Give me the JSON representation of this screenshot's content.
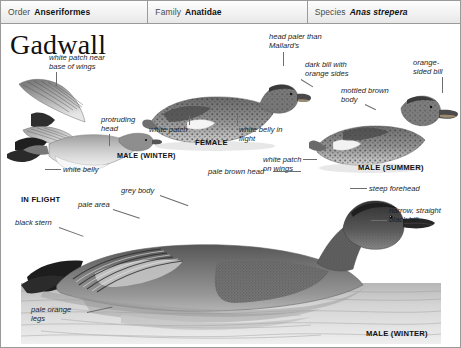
{
  "taxonomy": {
    "order": {
      "rank": "Order",
      "value": "Anseriformes"
    },
    "family": {
      "rank": "Family",
      "value": "Anatidae"
    },
    "species": {
      "rank": "Species",
      "value": "Anas strepera"
    }
  },
  "plate": {
    "title": "Gadwall",
    "annotations": {
      "white_patch_wings": "white patch near\nbase of wings",
      "protruding_head": "protruding\nhead",
      "white_belly": "white belly",
      "white_patch": "white patch",
      "head_paler": "head paler than\nMallard's",
      "dark_bill_orange": "dark bill with\norange sides",
      "white_belly_flight": "white belly in\nflight",
      "white_patch_wings2": "white patch\non wings",
      "orange_sided_bill": "orange-\nsided bill",
      "mottled_brown": "mottled brown\nbody",
      "pale_brown_head": "pale brown head",
      "steep_forehead": "steep forehead",
      "narrow_black_bill": "narrow, straight\nblack bill",
      "grey_body": "grey body",
      "pale_area": "pale area",
      "black_stern": "black stern",
      "pale_orange_legs": "pale orange\nlegs"
    },
    "captions": {
      "in_flight": "IN FLIGHT",
      "male_winter_flight": "MALE (WINTER)",
      "female": "FEMALE",
      "male_summer": "MALE (SUMMER)",
      "male_winter_main": "MALE (WINTER)"
    }
  },
  "colors": {
    "frame": "#9a9a9a",
    "text": "#1a1a1a",
    "leader": "#6d6d6d",
    "plumage_dark": "#3a3a3a",
    "plumage_mid": "#8d8d8d",
    "plumage_light": "#d8d8d8",
    "water": "#c9c9c9"
  }
}
